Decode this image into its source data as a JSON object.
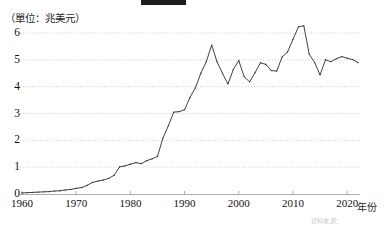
{
  "figure": {
    "title_redacted": true,
    "title_bar_color": "#1d1d1d",
    "unit_caption": "（單位：兆美元）",
    "source_note": "資料來源：",
    "background_color": "#ffffff"
  },
  "chart_data": {
    "type": "line",
    "title": "",
    "xlabel": "年份",
    "ylabel": "",
    "unit": "兆美元",
    "xlim": [
      1960,
      2022
    ],
    "ylim": [
      0,
      6.4
    ],
    "xticks": [
      1960,
      1970,
      1980,
      1990,
      2000,
      2010,
      2020
    ],
    "yticks": [
      0,
      1,
      2,
      3,
      4,
      5,
      6
    ],
    "grid": true,
    "grid_style": "dotted",
    "grid_color": "#bdbdbd",
    "line_color": "#2b2b2b",
    "marker": "square",
    "legend": "none",
    "x": [
      1960,
      1961,
      1962,
      1963,
      1964,
      1965,
      1966,
      1967,
      1968,
      1969,
      1970,
      1971,
      1972,
      1973,
      1974,
      1975,
      1976,
      1977,
      1978,
      1979,
      1980,
      1981,
      1982,
      1983,
      1984,
      1985,
      1986,
      1987,
      1988,
      1989,
      1990,
      1991,
      1992,
      1993,
      1994,
      1995,
      1996,
      1997,
      1998,
      1999,
      2000,
      2001,
      2002,
      2003,
      2004,
      2005,
      2006,
      2007,
      2008,
      2009,
      2010,
      2011,
      2012,
      2013,
      2014,
      2015,
      2016,
      2017,
      2018,
      2019,
      2020,
      2021,
      2022
    ],
    "values": [
      0.04,
      0.05,
      0.06,
      0.07,
      0.08,
      0.09,
      0.11,
      0.12,
      0.15,
      0.17,
      0.21,
      0.24,
      0.32,
      0.43,
      0.48,
      0.52,
      0.58,
      0.7,
      1.01,
      1.05,
      1.11,
      1.17,
      1.13,
      1.24,
      1.31,
      1.4,
      2.08,
      2.54,
      3.05,
      3.07,
      3.14,
      3.6,
      3.96,
      4.5,
      4.93,
      5.55,
      4.92,
      4.49,
      4.1,
      4.64,
      4.97,
      4.37,
      4.18,
      4.52,
      4.89,
      4.83,
      4.6,
      4.58,
      5.11,
      5.29,
      5.76,
      6.23,
      6.27,
      5.21,
      4.9,
      4.44,
      5.0,
      4.93,
      5.04,
      5.12,
      5.06,
      5.01,
      4.9
    ]
  }
}
